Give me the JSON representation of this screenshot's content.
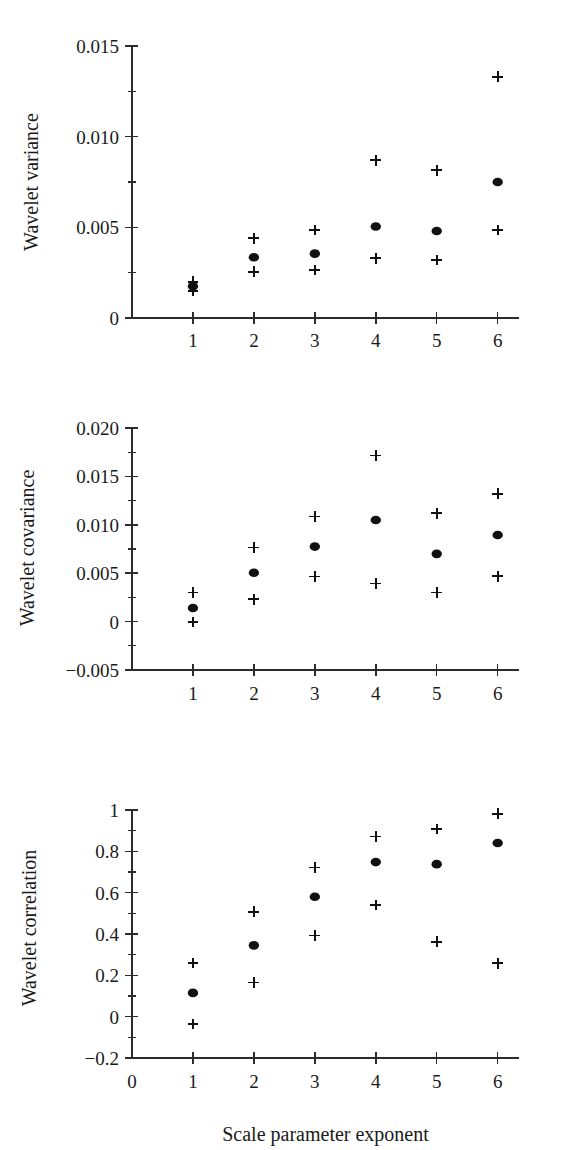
{
  "figure": {
    "xlabel": "Scale parameter exponent",
    "panels": [
      "variance",
      "covariance",
      "correlation"
    ]
  },
  "chart_data": [
    {
      "type": "scatter",
      "title": "",
      "xlabel": "",
      "ylabel": "Wavelet variance",
      "x": [
        1,
        2,
        3,
        4,
        5,
        6
      ],
      "xtick_labels": [
        "1",
        "2",
        "3",
        "4",
        "5",
        "6"
      ],
      "xlim": [
        0,
        6.35
      ],
      "ylim": [
        0,
        0.015
      ],
      "ytick_labels": [
        "0",
        "0.005",
        "0.010",
        "0.015"
      ],
      "ytick_values": [
        0,
        0.005,
        0.01,
        0.015
      ],
      "yminor_values": [
        0.0025,
        0.0075,
        0.0125
      ],
      "grid": false,
      "legend": "none",
      "series": [
        {
          "name": "estimate",
          "marker": "filled-circle",
          "values": [
            0.00175,
            0.00335,
            0.00355,
            0.00505,
            0.0048,
            0.0075
          ]
        },
        {
          "name": "upper confidence limit",
          "marker": "plus",
          "values": [
            0.002,
            0.0044,
            0.00485,
            0.0087,
            0.00815,
            0.0133
          ]
        },
        {
          "name": "lower confidence limit",
          "marker": "plus",
          "values": [
            0.0015,
            0.00255,
            0.00265,
            0.0033,
            0.0032,
            0.00485
          ]
        }
      ]
    },
    {
      "type": "scatter",
      "title": "",
      "xlabel": "",
      "ylabel": "Wavelet covariance",
      "x": [
        1,
        2,
        3,
        4,
        5,
        6
      ],
      "xtick_labels": [
        "1",
        "2",
        "3",
        "4",
        "5",
        "6"
      ],
      "xlim": [
        0,
        6.35
      ],
      "ylim": [
        -0.005,
        0.02
      ],
      "ytick_labels": [
        "-0.005",
        "0",
        "0.005",
        "0.010",
        "0.015",
        "0.020"
      ],
      "ytick_values": [
        -0.005,
        0,
        0.005,
        0.01,
        0.015,
        0.02
      ],
      "yminor_values": [
        -0.0025,
        0.0025,
        0.0075,
        0.0125,
        0.0175
      ],
      "grid": false,
      "legend": "none",
      "series": [
        {
          "name": "estimate",
          "marker": "filled-circle",
          "values": [
            0.0014,
            0.00505,
            0.00775,
            0.0105,
            0.007,
            0.00895
          ]
        },
        {
          "name": "upper confidence limit",
          "marker": "plus",
          "values": [
            0.003,
            0.00765,
            0.01085,
            0.01715,
            0.0112,
            0.0132
          ]
        },
        {
          "name": "lower confidence limit",
          "marker": "plus",
          "values": [
            -5e-05,
            0.0023,
            0.00465,
            0.00395,
            0.003,
            0.0047
          ]
        }
      ]
    },
    {
      "type": "scatter",
      "title": "",
      "xlabel": "Scale parameter exponent",
      "ylabel": "Wavelet correlation",
      "x": [
        1,
        2,
        3,
        4,
        5,
        6
      ],
      "xtick_labels": [
        "0",
        "1",
        "2",
        "3",
        "4",
        "5",
        "6"
      ],
      "xtick_values": [
        0,
        1,
        2,
        3,
        4,
        5,
        6
      ],
      "xlim": [
        0,
        6.35
      ],
      "ylim": [
        -0.2,
        1.0
      ],
      "ytick_labels": [
        "-0.2",
        "0",
        "0.2",
        "0.4",
        "0.6",
        "0.8",
        "1"
      ],
      "ytick_values": [
        -0.2,
        0,
        0.2,
        0.4,
        0.6,
        0.8,
        1.0
      ],
      "yminor_values": [
        -0.1,
        0.1,
        0.3,
        0.5,
        0.7,
        0.9
      ],
      "grid": false,
      "legend": "none",
      "series": [
        {
          "name": "estimate",
          "marker": "filled-circle",
          "values": [
            0.115,
            0.345,
            0.58,
            0.748,
            0.738,
            0.84
          ]
        },
        {
          "name": "upper confidence limit",
          "marker": "plus",
          "values": [
            0.26,
            0.508,
            0.722,
            0.872,
            0.908,
            0.982
          ]
        },
        {
          "name": "lower confidence limit",
          "marker": "plus",
          "values": [
            -0.035,
            0.165,
            0.393,
            0.54,
            0.362,
            0.258
          ]
        }
      ]
    }
  ]
}
